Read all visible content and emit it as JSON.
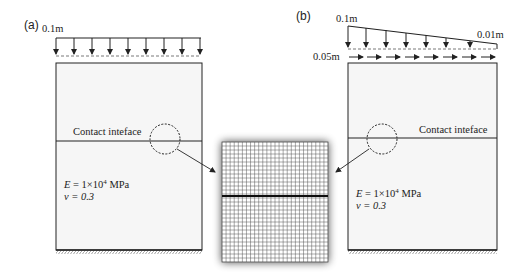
{
  "panels": [
    {
      "id": "a",
      "label": "(a)",
      "load": {
        "type": "uniform-vertical",
        "magnitude_label": "0.1m",
        "arrow_count": 9
      },
      "interface_label": "Contact inteface",
      "material": {
        "E_label": "E = 1×10",
        "E_exp": "4",
        "E_unit": " MPa",
        "nu_label": "v = 0.3"
      }
    },
    {
      "id": "b",
      "label": "(b)",
      "load": {
        "type": "linear-vertical",
        "left_label": "0.1m",
        "right_label": "0.01m",
        "arrow_count": 8
      },
      "shear_load": {
        "type": "uniform-horizontal",
        "magnitude_label": "0.05m",
        "arrow_count": 8
      },
      "interface_label": "Contact inteface",
      "material": {
        "E_label": "E = 1×10",
        "E_exp": "4",
        "E_unit": " MPa",
        "nu_label": "v = 0.3"
      }
    }
  ],
  "mesh": {
    "description": "structured quadrilateral mesh with contact interface",
    "columns": 26,
    "rows": 30
  },
  "colors": {
    "line": "#222222",
    "box_fill": "#f6f6f6",
    "dashed": "#555555",
    "mesh_line": "#444444"
  }
}
